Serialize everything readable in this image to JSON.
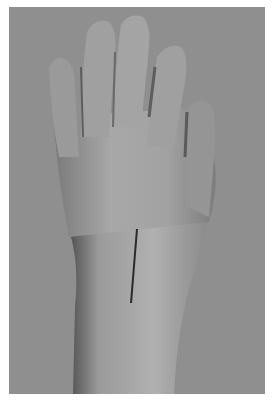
{
  "image": {
    "subject": "dorsal view of a hand and forearm with a straight marking line on the back of the wrist",
    "colors": {
      "background": "#8f8f8f",
      "skin_light": "#b4b4b4",
      "skin_mid": "#9c9c9c",
      "skin_shadow": "#5a5a5a",
      "marking_line": "#2a2a2a",
      "border": "#ffffff"
    }
  }
}
